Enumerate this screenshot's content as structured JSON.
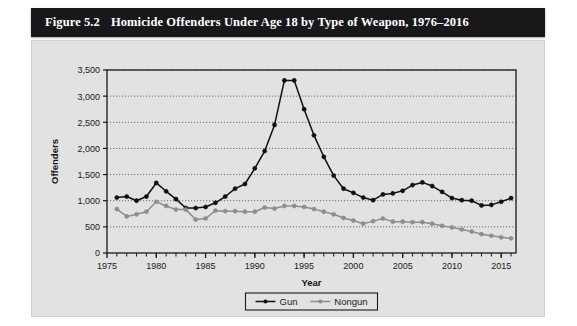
{
  "figure": {
    "number": "Figure 5.2",
    "title": "Homicide Offenders Under Age 18 by Type of Weapon, 1976–2016",
    "title_bar_color": "#18181a",
    "panel_color": "#e2e2e2"
  },
  "chart_data": {
    "type": "line",
    "title": "Homicide Offenders Under Age 18 by Type of Weapon, 1976–2016",
    "xlabel": "Year",
    "ylabel": "Offenders",
    "xlim": [
      1975,
      2016.5
    ],
    "ylim": [
      0,
      3500
    ],
    "ytick_labels": [
      "0",
      "500",
      "1,000",
      "1,500",
      "2,000",
      "2,500",
      "3,000",
      "3,500"
    ],
    "yticks": [
      0,
      500,
      1000,
      1500,
      2000,
      2500,
      3000,
      3500
    ],
    "xtick_labels": [
      "1975",
      "1980",
      "1985",
      "1990",
      "1995",
      "2000",
      "2005",
      "2010",
      "2015"
    ],
    "xticks": [
      1975,
      1980,
      1985,
      1990,
      1995,
      2000,
      2005,
      2010,
      2015
    ],
    "minor_xtick_step": 1,
    "grid": "horizontal-dotted",
    "legend_position": "bottom-center",
    "x": [
      1976,
      1977,
      1978,
      1979,
      1980,
      1981,
      1982,
      1983,
      1984,
      1985,
      1986,
      1987,
      1988,
      1989,
      1990,
      1991,
      1992,
      1993,
      1994,
      1995,
      1996,
      1997,
      1998,
      1999,
      2000,
      2001,
      2002,
      2003,
      2004,
      2005,
      2006,
      2007,
      2008,
      2009,
      2010,
      2011,
      2012,
      2013,
      2014,
      2015,
      2016
    ],
    "series": [
      {
        "name": "Gun",
        "color": "#101010",
        "marker": "filled-circle",
        "values": [
          1060,
          1080,
          1000,
          1080,
          1340,
          1180,
          1030,
          860,
          860,
          880,
          960,
          1080,
          1230,
          1320,
          1620,
          1950,
          2450,
          3300,
          3300,
          2750,
          2250,
          1840,
          1480,
          1230,
          1150,
          1060,
          1010,
          1120,
          1140,
          1190,
          1300,
          1350,
          1280,
          1170,
          1050,
          1010,
          1000,
          910,
          920,
          980,
          1050
        ]
      },
      {
        "name": "Nongun",
        "color": "#8e8e8e",
        "marker": "filled-circle",
        "values": [
          840,
          700,
          740,
          790,
          980,
          900,
          830,
          830,
          640,
          660,
          810,
          800,
          800,
          790,
          790,
          870,
          850,
          900,
          900,
          880,
          840,
          790,
          740,
          670,
          620,
          560,
          610,
          660,
          600,
          600,
          590,
          590,
          560,
          520,
          490,
          450,
          410,
          360,
          330,
          300,
          280
        ]
      }
    ]
  },
  "legend": {
    "items": [
      {
        "label": "Gun",
        "color": "#101010"
      },
      {
        "label": "Nongun",
        "color": "#8e8e8e"
      }
    ]
  }
}
